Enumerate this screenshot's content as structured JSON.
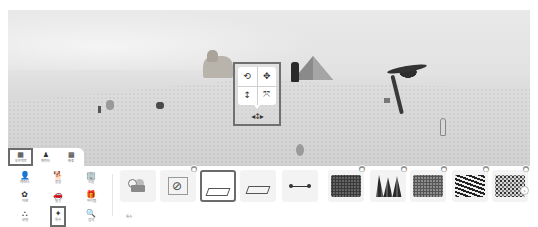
{
  "scene": {
    "objects": [
      "sphinx",
      "pyramid",
      "dark-figure",
      "palm-tree",
      "camel",
      "small-tree",
      "small-figure",
      "dog",
      "person",
      "rock"
    ]
  },
  "gizmo": {
    "buttons": [
      {
        "icon": "⟲",
        "name": "rotate"
      },
      {
        "icon": "✥",
        "name": "move"
      },
      {
        "icon": "↕",
        "name": "height"
      },
      {
        "icon": "⤧",
        "name": "scale"
      }
    ],
    "move_glyph": "◂↕▸"
  },
  "tabs": [
    {
      "icon": "▦",
      "label": "오브젝트",
      "active": true
    },
    {
      "icon": "♟",
      "label": "캐릭터",
      "active": false
    },
    {
      "icon": "▩",
      "label": "배경",
      "active": false
    }
  ],
  "categories": [
    {
      "icon": "👤",
      "label": "캐릭터",
      "active": false
    },
    {
      "icon": "🐕",
      "label": "동물",
      "active": false
    },
    {
      "icon": "🏢",
      "label": "건물",
      "active": false
    },
    {
      "icon": "✿",
      "label": "자연",
      "active": false
    },
    {
      "icon": "🚗",
      "label": "탈것",
      "active": false
    },
    {
      "icon": "🎁",
      "label": "아이템",
      "active": false
    },
    {
      "icon": "⛬",
      "label": "모형",
      "active": false
    },
    {
      "icon": "✦",
      "label": "특수",
      "active": true
    },
    {
      "icon": "🔍",
      "label": "검색",
      "active": false
    }
  ],
  "items": {
    "label": "특수",
    "cards": [
      {
        "kind": "camera",
        "badge": false,
        "selected": false
      },
      {
        "kind": "noentry",
        "badge": true,
        "selected": false
      },
      {
        "kind": "frame",
        "badge": false,
        "selected": true
      },
      {
        "kind": "frame-flat",
        "badge": false,
        "selected": false
      },
      {
        "kind": "line",
        "badge": false,
        "selected": false
      },
      {
        "kind": "hedge",
        "badge": true,
        "selected": false
      },
      {
        "kind": "trees",
        "badge": true,
        "selected": false
      },
      {
        "kind": "grass",
        "badge": true,
        "selected": false
      },
      {
        "kind": "zebra",
        "badge": true,
        "selected": false
      },
      {
        "kind": "flowers",
        "badge": true,
        "selected": false
      }
    ],
    "badge_glyph": "●",
    "next_glyph": "›"
  }
}
